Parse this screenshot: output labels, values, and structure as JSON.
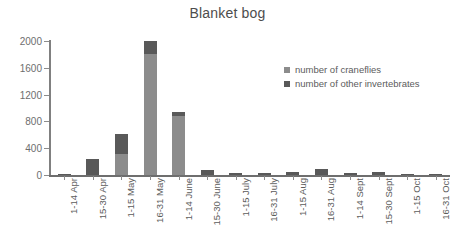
{
  "chart_data": {
    "type": "bar",
    "stacked": true,
    "title": "Blanket bog",
    "xlabel": "",
    "ylabel": "",
    "ylim": [
      0,
      2000
    ],
    "yticks": [
      0,
      400,
      800,
      1200,
      1600,
      2000
    ],
    "ytick_labels": [
      "0",
      "400",
      "800",
      "1200",
      "1600",
      "2000"
    ],
    "grid": false,
    "legend_position": "inside-upper-right",
    "categories": [
      "1-14 Apr",
      "15-30 Apr",
      "1-15 May",
      "16-31 May",
      "1-14 June",
      "15-30 June",
      "1-15 July",
      "16-31 July",
      "1-15 Aug",
      "16-31 Aug",
      "1-14 Sept",
      "15-30 Sept",
      "1-15 Oct",
      "16-31 Oct"
    ],
    "series": [
      {
        "name": "number of craneflies",
        "color": "#8c8c8c",
        "values": [
          0,
          0,
          310,
          1800,
          880,
          0,
          0,
          0,
          0,
          0,
          0,
          0,
          0,
          0
        ]
      },
      {
        "name": "number of other invertebrates",
        "color": "#595959",
        "values": [
          5,
          240,
          300,
          205,
          55,
          75,
          35,
          30,
          45,
          95,
          30,
          45,
          20,
          15
        ]
      }
    ],
    "totals": [
      5,
      240,
      610,
      2005,
      935,
      75,
      35,
      30,
      45,
      95,
      30,
      45,
      20,
      15
    ]
  },
  "colors": {
    "craneflies": "#8c8c8c",
    "other_invertebrates": "#595959",
    "axis": "#6e6e6e",
    "text": "#5c5c5c",
    "background": "#ffffff"
  },
  "legend": {
    "items": [
      {
        "label": "number of craneflies",
        "color": "#8c8c8c"
      },
      {
        "label": "number of other invertebrates",
        "color": "#595959"
      }
    ]
  }
}
